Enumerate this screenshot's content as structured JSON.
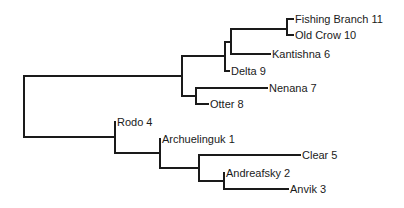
{
  "diagram": {
    "type": "dendrogram",
    "orientation": "left-to-right",
    "line_color": "#1a1a1a",
    "text_color": "#1a1a1a",
    "leaves": [
      {
        "id": "fishing-branch",
        "label": "Fishing Branch 11",
        "x": 293,
        "y": 19
      },
      {
        "id": "old-crow",
        "label": "Old Crow 10",
        "x": 293,
        "y": 35
      },
      {
        "id": "kantishna",
        "label": "Kantishna 6",
        "x": 270,
        "y": 54
      },
      {
        "id": "delta",
        "label": "Delta 9",
        "x": 229,
        "y": 71
      },
      {
        "id": "nenana",
        "label": "Nenana 7",
        "x": 267,
        "y": 88
      },
      {
        "id": "otter",
        "label": "Otter 8",
        "x": 208,
        "y": 104
      },
      {
        "id": "rodo",
        "label": "Rodo 4",
        "x": 115,
        "y": 122
      },
      {
        "id": "archuelinguk",
        "label": "Archuelinguk 1",
        "x": 160,
        "y": 139
      },
      {
        "id": "clear",
        "label": "Clear 5",
        "x": 300,
        "y": 155
      },
      {
        "id": "andreafsky",
        "label": "Andreafsky 2",
        "x": 224,
        "y": 173
      },
      {
        "id": "anvik",
        "label": "Anvik 3",
        "x": 288,
        "y": 189
      }
    ],
    "branches": [
      {
        "id": "root-vertical",
        "d": "M24 76 V137"
      },
      {
        "id": "root-to-upper",
        "d": "M24 76 H182"
      },
      {
        "id": "root-to-lower",
        "d": "M24 137 H115"
      },
      {
        "id": "upper-vertical",
        "d": "M182 56 V96"
      },
      {
        "id": "upper-to-delta-clade",
        "d": "M182 56 H225"
      },
      {
        "id": "upper-to-nenana-clade",
        "d": "M182 96 H196"
      },
      {
        "id": "delta-clade-vertical",
        "d": "M225 42 V71"
      },
      {
        "id": "delta-clade-to-kantishna-clade",
        "d": "M225 42 H231"
      },
      {
        "id": "delta-leaf",
        "d": "M225 71 H229"
      },
      {
        "id": "kantishna-clade-vertical",
        "d": "M231 29 V54"
      },
      {
        "id": "kantishna-clade-to-fishing-clade",
        "d": "M231 29 H287"
      },
      {
        "id": "kantishna-leaf",
        "d": "M231 54 H270"
      },
      {
        "id": "fishing-clade-vertical",
        "d": "M287 19 V35"
      },
      {
        "id": "fishing-branch-leaf",
        "d": "M287 19 H293"
      },
      {
        "id": "old-crow-leaf",
        "d": "M287 35 H293"
      },
      {
        "id": "nenana-clade-vertical",
        "d": "M196 88 V104"
      },
      {
        "id": "nenana-leaf",
        "d": "M196 88 H267"
      },
      {
        "id": "otter-leaf",
        "d": "M196 104 H208"
      },
      {
        "id": "rodo-clade-vertical",
        "d": "M115 122 V153"
      },
      {
        "id": "rodo-clade-to-arch-clade",
        "d": "M115 153 H160"
      },
      {
        "id": "arch-clade-vertical",
        "d": "M160 139 V168"
      },
      {
        "id": "arch-clade-to-clear-clade",
        "d": "M160 168 H199"
      },
      {
        "id": "clear-clade-vertical",
        "d": "M199 155 V181"
      },
      {
        "id": "clear-leaf",
        "d": "M199 155 H300"
      },
      {
        "id": "clear-clade-to-andreafsky-clade",
        "d": "M199 181 H224"
      },
      {
        "id": "andreafsky-clade-vertical",
        "d": "M224 173 V189"
      },
      {
        "id": "anvik-leaf",
        "d": "M224 189 H288"
      }
    ]
  }
}
